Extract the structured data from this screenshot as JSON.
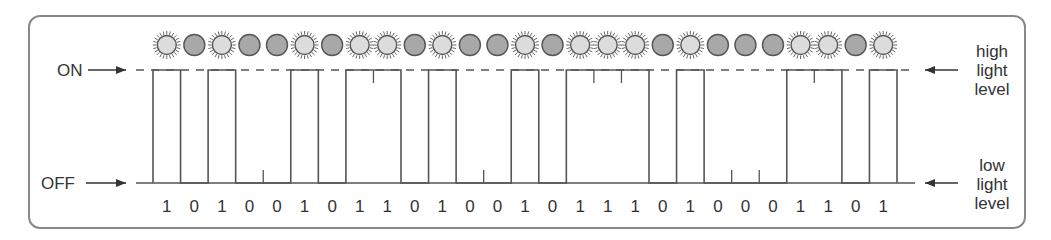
{
  "labels": {
    "on": "ON",
    "off": "OFF",
    "high_light": [
      "high",
      "light",
      "level"
    ],
    "low_light": [
      "low",
      "light",
      "level"
    ]
  },
  "colors": {
    "line": "#555555",
    "bulb_on_fill": "#dcdcdc",
    "bulb_off_fill": "#a8a8a8",
    "frame": "#888888"
  },
  "chart_data": {
    "type": "step",
    "title": "",
    "bits": [
      1,
      0,
      1,
      0,
      0,
      1,
      0,
      1,
      1,
      0,
      1,
      0,
      0,
      1,
      0,
      1,
      1,
      1,
      0,
      1,
      0,
      0,
      0,
      1,
      1,
      0,
      1
    ],
    "levels": {
      "1": "ON / high light level",
      "0": "OFF / low light level"
    },
    "indicator_icons": {
      "1": "glowing-bulb",
      "0": "dark-bulb"
    }
  }
}
